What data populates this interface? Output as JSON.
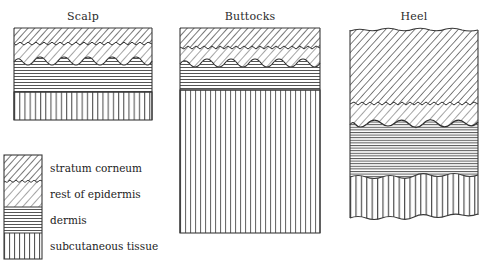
{
  "figure": {
    "type": "anatomical-cross-section-diagram",
    "background_color": "#ffffff",
    "ink_color": "#333333"
  },
  "panels": [
    {
      "id": "scalp",
      "title": "Scalp",
      "x": 14,
      "y": 10,
      "width": 138,
      "layers": [
        {
          "name": "stratum corneum",
          "pattern": "dense-diagonal",
          "thickness": 16,
          "top_edge": "flat",
          "bottom_edge": "sawtooth"
        },
        {
          "name": "rest of epidermis",
          "pattern": "sparse-diagonal",
          "thickness": 21,
          "top_edge": "sawtooth",
          "bottom_edge": "wave"
        },
        {
          "name": "dermis",
          "pattern": "horizontal",
          "thickness": 29,
          "top_edge": "wave",
          "bottom_edge": "flat"
        },
        {
          "name": "subcutaneous tissue",
          "pattern": "vertical",
          "thickness": 28,
          "top_edge": "flat",
          "bottom_edge": "flat"
        }
      ]
    },
    {
      "id": "buttocks",
      "title": "Buttocks",
      "x": 180,
      "y": 10,
      "width": 140,
      "layers": [
        {
          "name": "stratum corneum",
          "pattern": "dense-diagonal",
          "thickness": 20,
          "top_edge": "flat",
          "bottom_edge": "sawtooth"
        },
        {
          "name": "rest of epidermis",
          "pattern": "sparse-diagonal",
          "thickness": 18,
          "top_edge": "sawtooth",
          "bottom_edge": "wave"
        },
        {
          "name": "dermis",
          "pattern": "horizontal",
          "thickness": 25,
          "top_edge": "wave",
          "bottom_edge": "flat"
        },
        {
          "name": "subcutaneous tissue",
          "pattern": "vertical",
          "thickness": 143,
          "top_edge": "flat",
          "bottom_edge": "flat"
        }
      ]
    },
    {
      "id": "heel",
      "title": "Heel",
      "x": 350,
      "y": 10,
      "width": 128,
      "layers": [
        {
          "name": "stratum corneum",
          "pattern": "dense-diagonal",
          "thickness": 74,
          "top_edge": "rough",
          "bottom_edge": "sawtooth"
        },
        {
          "name": "rest of epidermis",
          "pattern": "sparse-diagonal",
          "thickness": 22,
          "top_edge": "sawtooth",
          "bottom_edge": "wave"
        },
        {
          "name": "dermis",
          "pattern": "horizontal",
          "thickness": 52,
          "top_edge": "wave",
          "bottom_edge": "wave2"
        },
        {
          "name": "subcutaneous tissue",
          "pattern": "vertical",
          "thickness": 42,
          "top_edge": "wave2",
          "bottom_edge": "wave3"
        }
      ]
    }
  ],
  "legend": {
    "items": [
      {
        "label": "stratum corneum",
        "pattern": "dense-diagonal"
      },
      {
        "label": "rest of epidermis",
        "pattern": "sparse-diagonal"
      },
      {
        "label": "dermis",
        "pattern": "horizontal"
      },
      {
        "label": "subcutaneous tissue",
        "pattern": "vertical"
      }
    ]
  }
}
